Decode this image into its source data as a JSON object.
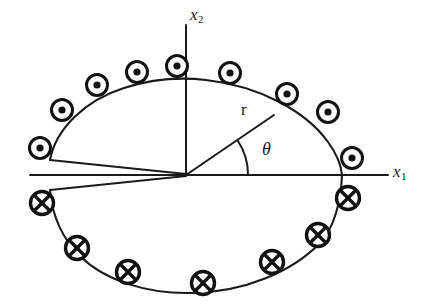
{
  "figure": {
    "axes": {
      "horizontal": {
        "name": "x1",
        "base": "x",
        "subscript": "1"
      },
      "vertical": {
        "name": "x2",
        "base": "x",
        "subscript": "2"
      }
    },
    "labels": {
      "radius": "r",
      "angle": "θ"
    },
    "colors": {
      "ink": "#1a1a1a",
      "background": "#ffffff",
      "marker_stroke": "#111111",
      "marker_fill": "#ffffff"
    }
  },
  "geometry": {
    "origin": {
      "x": 186,
      "y": 175
    },
    "ellipse": {
      "cx": 186,
      "cy": 182,
      "rx": 156,
      "ry": 98
    },
    "x1_axis": {
      "x1": 30,
      "y1": 175,
      "x2": 388,
      "y2": 175
    },
    "x2_axis": {
      "x1": 186,
      "y1": 25,
      "x2": 186,
      "y2": 175
    },
    "radius_ray": {
      "x1": 186,
      "y1": 175,
      "x2": 273,
      "y2": 116,
      "angle_deg": 34
    },
    "angle_arc": {
      "radius": 62,
      "start_deg": 0,
      "end_deg": 34
    },
    "slit": {
      "outer_upper": {
        "x": 50,
        "y": 160
      },
      "outer_lower": {
        "x": 50,
        "y": 190
      },
      "apex": {
        "x": 186,
        "y": 175
      }
    }
  },
  "markers": {
    "out_of_page": {
      "symbol": "dot-in-circle",
      "meaning": "current out of page",
      "positions": [
        {
          "x": 40,
          "y": 148
        },
        {
          "x": 62,
          "y": 110
        },
        {
          "x": 97,
          "y": 85
        },
        {
          "x": 137,
          "y": 72
        },
        {
          "x": 177,
          "y": 66
        },
        {
          "x": 230,
          "y": 73
        },
        {
          "x": 287,
          "y": 94
        },
        {
          "x": 328,
          "y": 112
        },
        {
          "x": 352,
          "y": 158
        }
      ]
    },
    "into_page": {
      "symbol": "cross-in-circle",
      "meaning": "current into page",
      "positions": [
        {
          "x": 42,
          "y": 203
        },
        {
          "x": 77,
          "y": 248
        },
        {
          "x": 128,
          "y": 272
        },
        {
          "x": 203,
          "y": 283
        },
        {
          "x": 272,
          "y": 262
        },
        {
          "x": 318,
          "y": 235
        },
        {
          "x": 348,
          "y": 198
        }
      ]
    }
  },
  "label_positions": {
    "x2": {
      "x": 190,
      "y": 6
    },
    "x1": {
      "x": 393,
      "y": 163
    },
    "r": {
      "x": 241,
      "y": 101
    },
    "theta": {
      "x": 262,
      "y": 140
    }
  }
}
